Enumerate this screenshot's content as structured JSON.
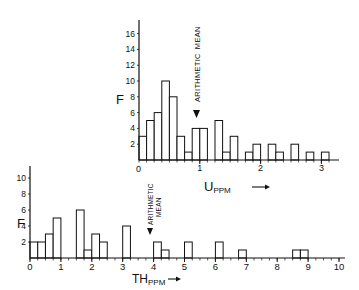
{
  "chart_data": [
    {
      "type": "bar",
      "title": "",
      "xlabel": "U PPM →",
      "xlabel_main": "U",
      "xlabel_sub": "PPM",
      "ylabel": "F",
      "xlim": [
        0,
        3.2
      ],
      "ylim": [
        0,
        16
      ],
      "bin_width": 0.125,
      "bin_start": 0,
      "x_ticks": [
        "0",
        "1",
        "2",
        "3"
      ],
      "y_ticks": [
        "2",
        "4",
        "6",
        "8",
        "10",
        "12",
        "14",
        "16"
      ],
      "values": [
        3,
        5,
        6,
        10,
        8,
        3,
        1,
        4,
        4,
        0,
        5,
        1,
        3,
        0,
        1,
        2,
        0,
        2,
        1,
        0,
        2,
        0,
        1,
        0,
        1
      ],
      "annotation": {
        "text": "Arithmetic Mean",
        "x": 0.95,
        "marker": "▼"
      },
      "grid": false
    },
    {
      "type": "bar",
      "title": "",
      "xlabel": "TH PPM →",
      "xlabel_main": "TH",
      "xlabel_sub": "PPM",
      "ylabel": "F",
      "xlim": [
        0,
        10
      ],
      "ylim": [
        0,
        10
      ],
      "bin_width": 0.25,
      "bin_start": 0,
      "x_ticks": [
        "0",
        "1",
        "2",
        "3",
        "4",
        "5",
        "6",
        "7",
        "8",
        "9",
        "10"
      ],
      "y_ticks": [
        "2",
        "4",
        "6",
        "8",
        "10"
      ],
      "values": [
        2,
        2,
        3,
        5,
        0,
        0,
        6,
        1,
        3,
        2,
        0,
        0,
        4,
        0,
        0,
        0,
        2,
        1,
        0,
        0,
        2,
        0,
        0,
        0,
        2,
        0,
        0,
        1,
        0,
        0,
        0,
        0,
        0,
        0,
        1,
        1,
        0,
        0,
        0,
        0
      ],
      "annotation": {
        "text": "Arithmetic Mean",
        "x": 3.85,
        "marker": "▼"
      },
      "grid": false
    }
  ],
  "labels": {
    "top_mean_1": "ARITHMETIC",
    "top_mean_2": "MEAN",
    "bottom_mean_1": "ARITHMETIC",
    "bottom_mean_2": "MEAN",
    "top_ylabel": "F",
    "bottom_ylabel": "F"
  }
}
